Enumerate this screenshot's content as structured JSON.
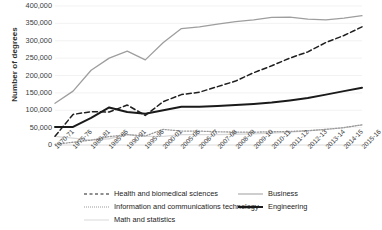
{
  "chart_data": {
    "type": "line",
    "title": "",
    "xlabel": "",
    "ylabel": "Number of degrees",
    "ylim": [
      0,
      400000
    ],
    "ytick_labels": [
      "400,000",
      "350,000",
      "300,000",
      "250,000",
      "200,000",
      "150,000",
      "100,000",
      "50,000",
      "0"
    ],
    "ytick_values": [
      400000,
      350000,
      300000,
      250000,
      200000,
      150000,
      100000,
      50000,
      0
    ],
    "grid": true,
    "legend_position": "below",
    "categories": [
      "1970-71",
      "1975-76",
      "1980-81",
      "1985-86",
      "1990-91",
      "1995-96",
      "2000-01",
      "2005-06",
      "2006-07",
      "2007-08",
      "2008-09",
      "2009-10",
      "2010-11",
      "2011-12",
      "2012-13",
      "2013-14",
      "2014-15",
      "2015-16"
    ],
    "series": [
      {
        "name": "Health and biomedical sciences",
        "style": "dashed",
        "color": "#1f1f1f",
        "values": [
          25000,
          88000,
          96000,
          95000,
          115000,
          85000,
          125000,
          145000,
          152000,
          168000,
          184000,
          208000,
          228000,
          250000,
          268000,
          295000,
          315000,
          340000
        ]
      },
      {
        "name": "Information and communications technology",
        "style": "dotted",
        "color": "#9a9a9a",
        "values": [
          2000,
          8000,
          14000,
          24000,
          30000,
          26000,
          45000,
          40000,
          40000,
          38000,
          37000,
          37000,
          38000,
          39000,
          41000,
          45000,
          50000,
          58000
        ]
      },
      {
        "name": "Math and statistics",
        "style": "thin",
        "color": "#d9d9d9",
        "values": [
          25000,
          20000,
          14000,
          18000,
          30000,
          25000,
          25000,
          30000,
          30000,
          30000,
          31000,
          32000,
          34000,
          37000,
          41000,
          45000,
          50000,
          58000
        ]
      },
      {
        "name": "Business",
        "style": "gray",
        "color": "#9e9e9e",
        "values": [
          120000,
          155000,
          215000,
          250000,
          270000,
          245000,
          295000,
          335000,
          340000,
          348000,
          355000,
          360000,
          367000,
          368000,
          362000,
          360000,
          365000,
          372000
        ]
      },
      {
        "name": "Engineering",
        "style": "black",
        "color": "#1a1a1a",
        "values": [
          52000,
          52000,
          78000,
          108000,
          95000,
          90000,
          100000,
          110000,
          110000,
          112000,
          115000,
          118000,
          122000,
          128000,
          135000,
          145000,
          155000,
          165000
        ]
      }
    ]
  },
  "legend": {
    "items": [
      {
        "label": "Health and biomedical sciences"
      },
      {
        "label": "Information and communications technology"
      },
      {
        "label": "Math and statistics"
      },
      {
        "label": "Business"
      },
      {
        "label": "Engineering"
      }
    ]
  }
}
